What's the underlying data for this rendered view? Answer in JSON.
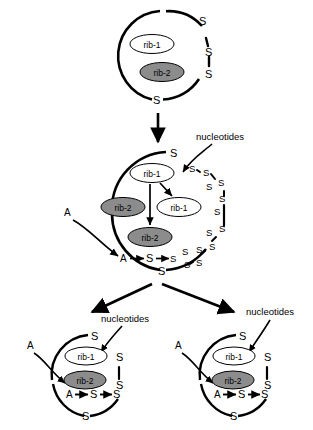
{
  "figure": {
    "background": "#ffffff",
    "stroke_color": "#000000",
    "rib2_fill": "#8c8c8c",
    "rib1_fill": "#ffffff"
  },
  "labels": {
    "rib1": "rib-1",
    "rib2": "rib-2",
    "sulfur": "S",
    "substrate": "A",
    "nucleotides": "nucleotides"
  },
  "stages": [
    {
      "id": "parent-cell",
      "name": "parent protocell",
      "contents": [
        "rib-1",
        "rib-2"
      ],
      "membrane_units": [
        "S",
        "S",
        "S",
        "S"
      ]
    },
    {
      "id": "growing-cell",
      "name": "growing protocell",
      "contents": [
        "rib-1",
        "rib-1",
        "rib-2",
        "rib-2"
      ],
      "reaction": [
        "A",
        "S",
        "S"
      ],
      "nucleotides_label": "nucleotides",
      "substrate_label": "A"
    },
    {
      "id": "daughter-cell-left",
      "name": "daughter protocell left",
      "contents": [
        "rib-1",
        "rib-2"
      ],
      "reaction": [
        "A",
        "S",
        "S"
      ],
      "nucleotides_label": "nucleotides",
      "substrate_label": "A"
    },
    {
      "id": "daughter-cell-right",
      "name": "daughter protocell right",
      "contents": [
        "rib-1",
        "rib-2"
      ],
      "reaction": [
        "A",
        "S",
        "S"
      ],
      "nucleotides_label": "nucleotides",
      "substrate_label": "A"
    }
  ],
  "text": {
    "nuc_mid": "nucleotides",
    "nuc_left": "nucleotides",
    "nuc_right": "nucleotides",
    "a_mid": "A",
    "a_left": "A",
    "a_right": "A",
    "s": "S",
    "rib1": "rib-1",
    "rib2": "rib-2"
  }
}
